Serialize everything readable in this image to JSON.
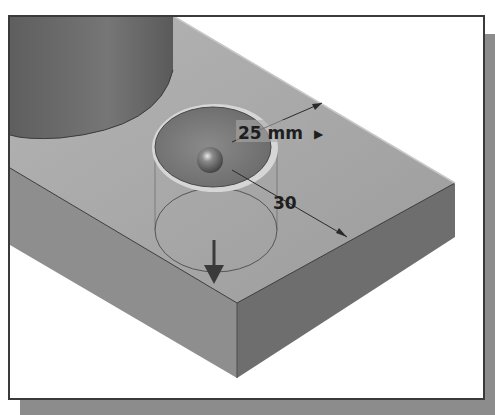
{
  "figure": {
    "colors": {
      "top_face": "#a4a4a4",
      "front_face": "#8e8e8e",
      "right_face": "#6e6e6e",
      "cylinder": "#6a6a6a",
      "frame_border": "#3a3a3a",
      "shadow": "#8c8c8c",
      "dimension_text": "#1e1e1e"
    }
  },
  "dimensions": {
    "diameter_label": "25 mm",
    "diameter_arrow": "▶",
    "distance_label": "30"
  },
  "icons": {
    "direction_arrow": "down-arrow",
    "grip_point": "sphere-handle"
  }
}
